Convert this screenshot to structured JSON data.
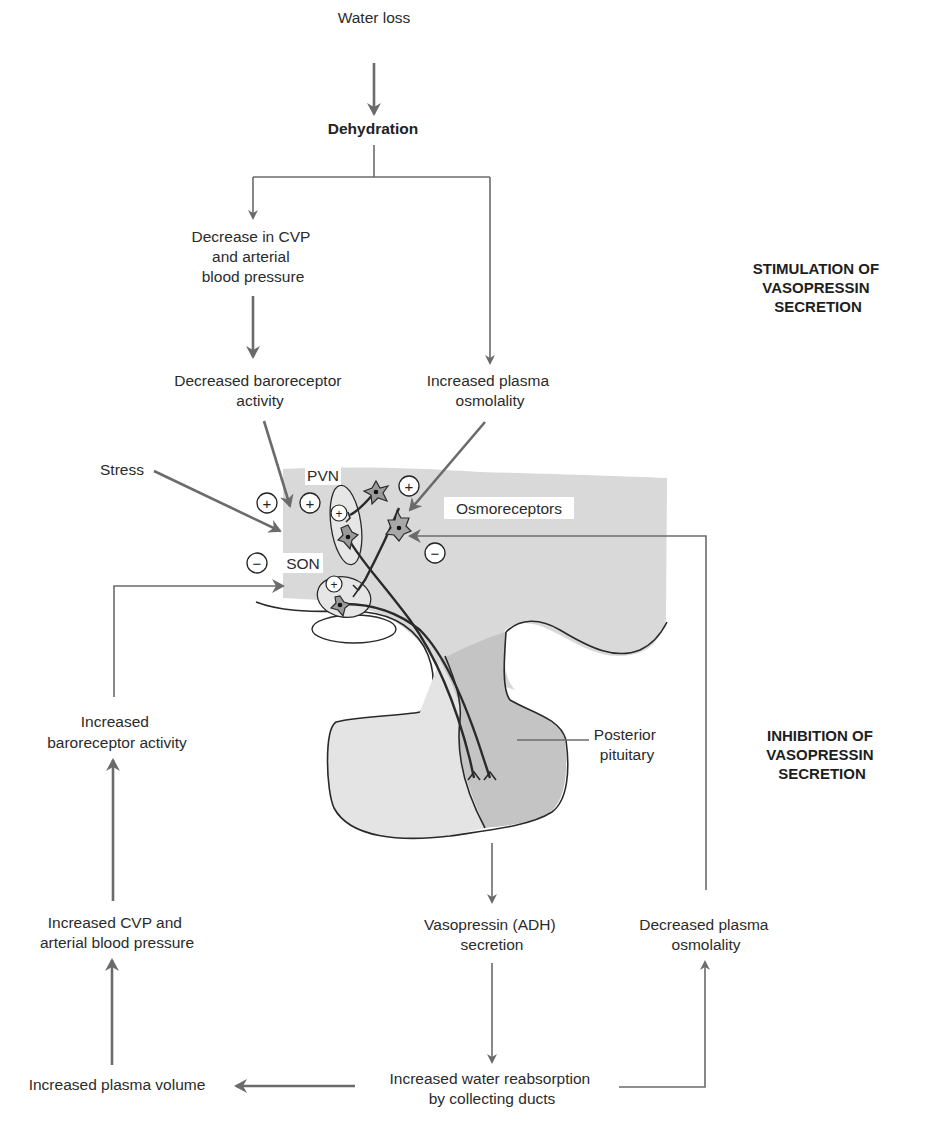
{
  "colors": {
    "arrow": "#6b6b6b",
    "brain_fill": "#d9d9d9",
    "anterior_pituitary_fill": "#e2e2e2",
    "posterior_pituitary_fill": "#c3c3c3",
    "neuron_fill": "#9a9a9a",
    "text": "#2b2b2b"
  },
  "sections": {
    "stimulation": [
      "STIMULATION OF",
      "VASOPRESSIN",
      "SECRETION"
    ],
    "inhibition": [
      "INHIBITION OF",
      "VASOPRESSIN",
      "SECRETION"
    ]
  },
  "nodes": {
    "water_loss": [
      "Water loss"
    ],
    "dehydration": [
      "Dehydration"
    ],
    "decrease_cvp": [
      "Decrease in CVP",
      "and arterial",
      "blood pressure"
    ],
    "decreased_baroreceptor": [
      "Decreased baroreceptor",
      "activity"
    ],
    "increased_osmolality": [
      "Increased plasma",
      "osmolality"
    ],
    "stress": [
      "Stress"
    ],
    "increased_baroreceptor": [
      "Increased",
      "baroreceptor activity"
    ],
    "increased_cvp": [
      "Increased CVP and",
      "arterial blood pressure"
    ],
    "increased_plasma_volume": [
      "Increased plasma volume"
    ],
    "vasopressin_secretion": [
      "Vasopressin (ADH)",
      "secretion"
    ],
    "decreased_osmolality": [
      "Decreased plasma",
      "osmolality"
    ],
    "water_reabsorption": [
      "Increased water reabsorption",
      "by collecting ducts"
    ]
  },
  "anatomy_labels": {
    "pvn": "PVN",
    "son": "SON",
    "osmoreceptors": "Osmoreceptors",
    "posterior_pituitary": [
      "Posterior",
      "pituitary"
    ]
  },
  "signs": {
    "plus": "+",
    "minus": "−"
  },
  "edges": [
    {
      "from": "Water loss",
      "to": "Dehydration",
      "effect": "stimulates"
    },
    {
      "from": "Dehydration",
      "to": "Decrease in CVP and arterial blood pressure"
    },
    {
      "from": "Dehydration",
      "to": "Increased plasma osmolality"
    },
    {
      "from": "Decrease in CVP and arterial blood pressure",
      "to": "Decreased baroreceptor activity"
    },
    {
      "from": "Decreased baroreceptor activity",
      "to": "PVN/SON",
      "effect": "+"
    },
    {
      "from": "Stress",
      "to": "PVN/SON",
      "effect": "+"
    },
    {
      "from": "Increased plasma osmolality",
      "to": "Osmoreceptors",
      "effect": "+"
    },
    {
      "from": "Increased baroreceptor activity",
      "to": "PVN/SON",
      "effect": "−"
    },
    {
      "from": "Decreased plasma osmolality",
      "to": "Osmoreceptors",
      "effect": "−"
    },
    {
      "from": "Posterior pituitary",
      "to": "Vasopressin (ADH) secretion"
    },
    {
      "from": "Vasopressin (ADH) secretion",
      "to": "Increased water reabsorption by collecting ducts"
    },
    {
      "from": "Increased water reabsorption by collecting ducts",
      "to": "Increased plasma volume"
    },
    {
      "from": "Increased water reabsorption by collecting ducts",
      "to": "Decreased plasma osmolality"
    },
    {
      "from": "Increased plasma volume",
      "to": "Increased CVP and arterial blood pressure"
    },
    {
      "from": "Increased CVP and arterial blood pressure",
      "to": "Increased baroreceptor activity"
    }
  ]
}
